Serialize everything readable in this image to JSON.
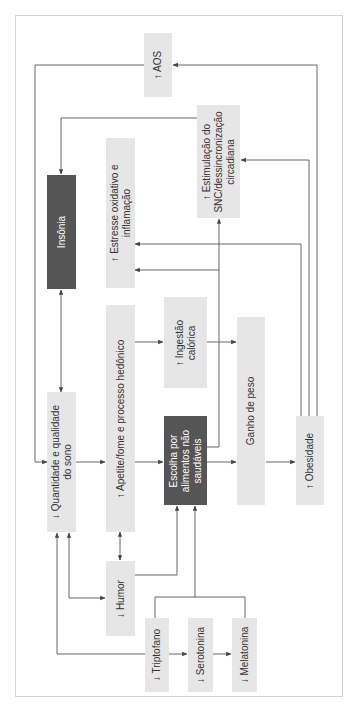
{
  "diagram": {
    "type": "flowchart",
    "orientation": "rotated-90-ccw",
    "colors": {
      "box_light": "#e6e6e6",
      "box_dark": "#555555",
      "line": "#555555",
      "frame": "#d4d4d4"
    },
    "nodes": {
      "aos": {
        "label": "↑ AOS"
      },
      "estimulacao": {
        "label": "↑ Estimulação do\nSNC/dessincronização\ncircadiana"
      },
      "insonia": {
        "label": "Insônia"
      },
      "estresse": {
        "label": "↑ Estresse oxidativo e\ninflamação"
      },
      "quantidade_sono": {
        "label": "↓ Quantidade e qualidade\ndo sono"
      },
      "apetite": {
        "label": "↑ Apetite/fome e processo hedônico"
      },
      "ingestao": {
        "label": "↑ Ingestão\ncalórica"
      },
      "escolha": {
        "label": "Escolha por\nalimentos não\nsaudáveis"
      },
      "ganho_peso": {
        "label": "Ganho de peso"
      },
      "obesidade": {
        "label": "↑ Obesidade"
      },
      "humor": {
        "label": "↓ Humor"
      },
      "triptofano": {
        "label": "↓ Triptofano"
      },
      "serotonina": {
        "label": "↓ Serotonina"
      },
      "melatonina": {
        "label": "↓ Melatonina"
      }
    },
    "edges": [
      {
        "from": "Quantidade e qualidade do sono",
        "to": "AOS",
        "type": "bidirectional-loop"
      },
      {
        "from": "Estimulação do SNC",
        "to": "Insônia"
      },
      {
        "from": "Insônia",
        "to": "Quantidade e qualidade do sono",
        "type": "bidirectional"
      },
      {
        "from": "Quantidade e qualidade do sono",
        "to": "Apetite/fome"
      },
      {
        "from": "Apetite/fome",
        "to": "Ingestão calórica"
      },
      {
        "from": "Apetite/fome",
        "to": "Escolha por alimentos não saudáveis"
      },
      {
        "from": "Ingestão calórica",
        "to": "Ganho de peso"
      },
      {
        "from": "Escolha por alimentos não saudáveis",
        "to": "Ganho de peso"
      },
      {
        "from": "Escolha por alimentos não saudáveis",
        "to": "Estimulação do SNC"
      },
      {
        "from": "Escolha por alimentos não saudáveis",
        "to": "Estresse oxidativo e inflamação"
      },
      {
        "from": "Ganho de peso",
        "to": "Obesidade"
      },
      {
        "from": "Obesidade",
        "to": "Estresse oxidativo e inflamação"
      },
      {
        "from": "Obesidade",
        "to": "Estimulação do SNC"
      },
      {
        "from": "Obesidade",
        "to": "AOS"
      },
      {
        "from": "Apetite/fome",
        "to": "Humor",
        "type": "bidirectional"
      },
      {
        "from": "Humor",
        "to": "Quantidade e qualidade do sono",
        "type": "bidirectional"
      },
      {
        "from": "Humor",
        "to": "Escolha por alimentos não saudáveis"
      },
      {
        "from": "Triptofano/Melatonina",
        "to": "Escolha por alimentos não saudáveis"
      },
      {
        "from": "Triptofano",
        "to": "Quantidade e qualidade do sono"
      },
      {
        "from": "Triptofano",
        "to": "Serotonina"
      },
      {
        "from": "Serotonina",
        "to": "Melatonina"
      }
    ]
  }
}
